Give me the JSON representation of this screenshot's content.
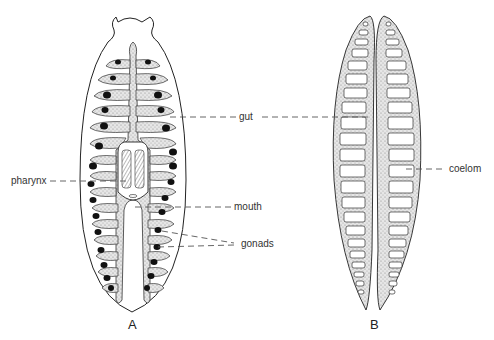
{
  "figure": {
    "panels": [
      {
        "id": "A",
        "label": "A",
        "description": "Flatworm body plan with branched gut, pharynx, mouth and gonads"
      },
      {
        "id": "B",
        "label": "B",
        "description": "Longitudinal section showing gut and segmented coelom"
      }
    ],
    "labels": {
      "gut": "gut",
      "pharynx": "pharynx",
      "mouth": "mouth",
      "gonads": "gonads",
      "coelom": "coelom"
    },
    "colors": {
      "outline": "#222222",
      "stipple": "#bdbdbd",
      "gonad": "#111111",
      "leader": "#555555"
    }
  }
}
